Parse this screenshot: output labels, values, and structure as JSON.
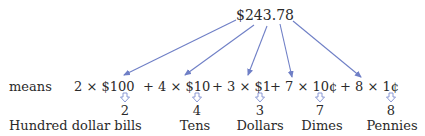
{
  "total": "$243.78",
  "means_label": "means",
  "colors": {
    "arrow": "#6f7fc6",
    "text": "#2a2a2a"
  },
  "expression": [
    {
      "coef": "2",
      "times": "×",
      "unit": "$100"
    },
    {
      "op": "+",
      "coef": "4",
      "times": "×",
      "unit": "$10"
    },
    {
      "op": "+",
      "coef": "3",
      "times": "×",
      "unit": "$1"
    },
    {
      "op": "+",
      "coef": "7",
      "times": "×",
      "unit": "10¢"
    },
    {
      "op": "+",
      "coef": "8",
      "times": "×",
      "unit": "1¢"
    }
  ],
  "terms": [
    {
      "text": "2 × $100"
    },
    {
      "text": "+ 4 × $10"
    },
    {
      "text": "+ 3 × $1"
    },
    {
      "text": "+ 7 × 10¢"
    },
    {
      "text": "+ 8 × 1¢"
    }
  ],
  "counts": [
    "2",
    "4",
    "3",
    "7",
    "8"
  ],
  "denominations": [
    "Hundred dollar bills",
    "Tens",
    "Dollars",
    "Dimes",
    "Pennies"
  ]
}
